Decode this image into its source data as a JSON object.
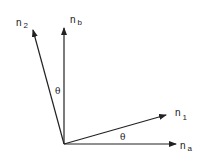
{
  "diagram": {
    "origin": {
      "x": 64,
      "y": 144
    },
    "vectors": [
      {
        "id": "n_a",
        "label": "n",
        "subscript": "a",
        "end": {
          "x": 176,
          "y": 144
        }
      },
      {
        "id": "n_b",
        "label": "n",
        "subscript": "b",
        "end": {
          "x": 64,
          "y": 28
        }
      },
      {
        "id": "n_1",
        "label": "n",
        "subscript": "1",
        "end": {
          "x": 166,
          "y": 115
        }
      },
      {
        "id": "n_2",
        "label": "n",
        "subscript": "2",
        "end": {
          "x": 33,
          "y": 30
        }
      }
    ],
    "angles": [
      {
        "id": "theta_lower",
        "label": "θ",
        "between": [
          "n_a",
          "n_1"
        ]
      },
      {
        "id": "theta_upper",
        "label": "θ",
        "between": [
          "n_b",
          "n_2"
        ]
      }
    ],
    "colors": {
      "stroke": "#222222",
      "background": "#ffffff"
    }
  }
}
